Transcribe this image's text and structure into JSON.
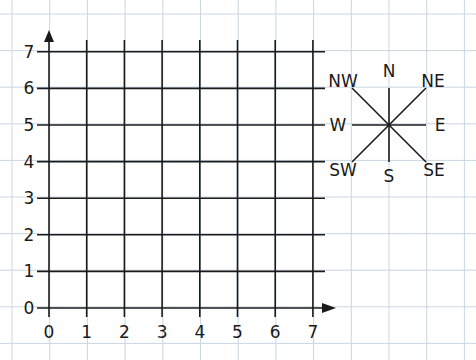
{
  "colors": {
    "paper": "#ffffff",
    "paper_grid": "#c9d6e3",
    "ink": "#1a1a1a"
  },
  "graph": {
    "x_axis": {
      "min": 0,
      "max": 7,
      "tick_labels": [
        "0",
        "1",
        "2",
        "3",
        "4",
        "5",
        "6",
        "7"
      ]
    },
    "y_axis": {
      "min": 0,
      "max": 7,
      "tick_labels": [
        "0",
        "1",
        "2",
        "3",
        "4",
        "5",
        "6",
        "7"
      ]
    }
  },
  "compass": {
    "labels": {
      "n": "N",
      "s": "S",
      "e": "E",
      "w": "W",
      "ne": "NE",
      "nw": "NW",
      "se": "SE",
      "sw": "SW"
    }
  }
}
